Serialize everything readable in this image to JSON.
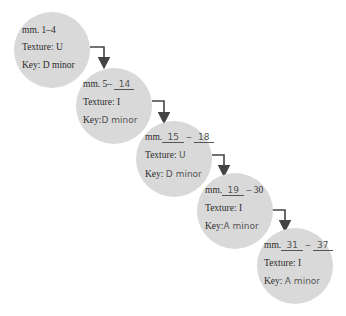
{
  "diagram": {
    "type": "flow",
    "direction": "top-left to bottom-right",
    "colors": {
      "circle_fill": "#d9d9d9",
      "text": "#2b2b2b",
      "handwriting": "#555555",
      "arrow": "#444444"
    },
    "sections": [
      {
        "mm_prefix": "mm. ",
        "mm_range": "1–4",
        "texture_label": "Texture:",
        "texture": "U",
        "key_label": "Key:",
        "key": "D minor"
      },
      {
        "mm_prefix": "mm. 5–",
        "mm_end": "14",
        "texture_label": "Texture:",
        "texture": "I",
        "key_label": "Key:",
        "key": "D minor"
      },
      {
        "mm_prefix": "mm.",
        "mm_start": "15",
        "mm_sep": "–",
        "mm_end": "18",
        "texture_label": "Texture:",
        "texture": "U",
        "key_label": "Key:",
        "key": "D minor"
      },
      {
        "mm_prefix": "mm.",
        "mm_start": "19",
        "mm_sep": "– 30",
        "texture_label": "Texture:",
        "texture": "I",
        "key_label": "Key:",
        "key": "A minor"
      },
      {
        "mm_prefix": "mm.",
        "mm_start": "31",
        "mm_sep": "–",
        "mm_end": "37",
        "texture_label": "Texture:",
        "texture": "I",
        "key_label": "Key:",
        "key": "A minor"
      }
    ]
  }
}
